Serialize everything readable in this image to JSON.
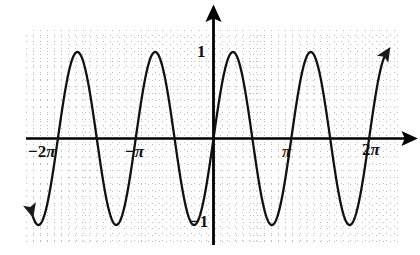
{
  "figure": {
    "name": "sine-wave-graph",
    "background": "#ffffff",
    "curve_color": "#111111",
    "axis_color": "#000000",
    "grid_color": "#b9b9b9"
  },
  "labels": {
    "x_neg_2pi": "−2π",
    "x_neg_pi": "−2π",
    "x_neg_pi_text": "−π",
    "x_pi": "π",
    "x_2pi": "2π",
    "y_one": "1",
    "y_neg_one": "−1"
  },
  "chart_data": {
    "type": "line",
    "title": "",
    "xlabel": "",
    "ylabel": "",
    "function": "y = sin(2x)",
    "xlim": [
      -7.3668,
      6.9629
    ],
    "ylim": [
      -1.3953,
      1.4186
    ],
    "xtick_labels": [
      "−2π",
      "−π",
      "π",
      "2π"
    ],
    "xtick_values": [
      -6.2832,
      -3.1416,
      3.1416,
      6.2832
    ],
    "ytick_labels": [
      "1",
      "−1"
    ],
    "ytick_values": [
      1,
      -1
    ],
    "grid": true,
    "grid_style": "dotted",
    "grid_spacing_x": 0.2833,
    "grid_spacing_y": 0.2558,
    "legend": "none",
    "amplitude": 1,
    "period": 3.1416,
    "zero_crossings": [
      -6.2832,
      -5.4978,
      -4.7124,
      -3.927,
      -3.1416,
      -2.3562,
      -1.5708,
      -0.7854,
      0,
      0.7854,
      1.5708,
      2.3562,
      3.1416,
      3.927,
      4.7124,
      5.4978,
      6.2832
    ],
    "maxima_x": [
      -5.8905,
      -4.3197,
      -2.7489,
      -1.1781,
      0.3927,
      1.9635,
      3.5343,
      5.1051
    ],
    "minima_x": [
      -5.1051,
      -3.5343,
      -1.9635,
      -0.3927,
      1.1781,
      2.7489,
      4.3197,
      5.8905
    ],
    "x": [
      -7.3668,
      -7.2,
      -7.0,
      -6.8,
      -6.6,
      -6.4,
      -6.2,
      -6.0,
      -5.8,
      -5.6,
      -5.4,
      -5.2,
      -5.0,
      -4.8,
      -4.6,
      -4.4,
      -4.2,
      -4.0,
      -3.8,
      -3.6,
      -3.4,
      -3.2,
      -3.0,
      -2.8,
      -2.6,
      -2.4,
      -2.2,
      -2.0,
      -1.8,
      -1.6,
      -1.4,
      -1.2,
      -1.0,
      -0.8,
      -0.6,
      -0.4,
      -0.2,
      0.0,
      0.2,
      0.4,
      0.6,
      0.8,
      1.0,
      1.2,
      1.4,
      1.6,
      1.8,
      2.0,
      2.2,
      2.4,
      2.6,
      2.8,
      3.0,
      3.2,
      3.4,
      3.6,
      3.8,
      4.0,
      4.2,
      4.4,
      4.6,
      4.8,
      5.0,
      5.2,
      5.4,
      5.6,
      5.8,
      6.0,
      6.2,
      6.4,
      6.6,
      6.8,
      6.9629
    ],
    "y": [
      0.9978,
      0.9564,
      0.8716,
      0.7144,
      0.4969,
      0.2347,
      -0.0484,
      -0.3272,
      -0.5767,
      -0.7738,
      -0.9037,
      -0.9577,
      -0.932,
      -0.8305,
      -0.6625,
      -0.4425,
      -0.1865,
      0.0887,
      0.3629,
      0.6118,
      0.8133,
      0.9467,
      0.9975,
      0.9609,
      0.8366,
      0.6353,
      0.3743,
      0.7568,
      0.4425,
      0.0584,
      -0.335,
      -0.6755,
      -0.9093,
      -0.9996,
      -0.932,
      -0.7174,
      -0.3894,
      0.0,
      0.3894,
      0.7174,
      0.932,
      0.9996,
      0.9093,
      0.6755,
      0.335,
      -0.0584,
      -0.4425,
      -0.7568,
      -0.9516,
      -0.9962,
      -0.8835,
      -0.6354,
      -0.2794,
      0.1165,
      0.4941,
      0.7937,
      0.9738,
      0.9894,
      0.8546,
      0.5945,
      0.2513,
      -0.1241,
      -0.4704,
      -0.7468,
      -0.9246,
      -0.9879,
      -0.932,
      -0.5366,
      -0.1865,
      0.1865,
      0.5298,
      0.805,
      0.9287
    ]
  },
  "elements": {
    "x_axis_name": "x-axis",
    "y_axis_name": "y-axis",
    "curve_name": "sine-curve"
  }
}
